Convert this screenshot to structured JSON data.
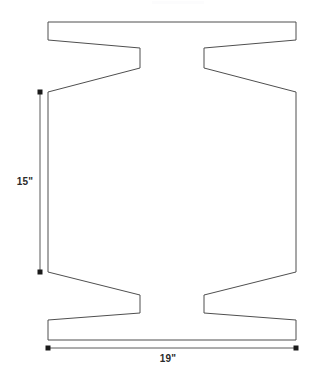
{
  "drawing": {
    "title": "Dimensioned flat pattern part drawing",
    "background_color": "#ffffff",
    "outline_color": "#4f4f4f",
    "dimension_color": "#5a5a5a",
    "label_color": "#2b2b2b",
    "canvas": {
      "width": 313,
      "height": 380
    }
  },
  "dimensions": {
    "height": {
      "label": "15\"",
      "value": 15,
      "unit": "inch",
      "orientation": "vertical",
      "line": {
        "x": 40,
        "y_start": 92,
        "y_end": 272
      },
      "endpoints": [
        {
          "x": 40,
          "y": 92
        },
        {
          "x": 40,
          "y": 272
        }
      ]
    },
    "width": {
      "label": "19\"",
      "value": 19,
      "unit": "inch",
      "orientation": "horizontal",
      "line": {
        "y": 348,
        "x_start": 48,
        "x_end": 296
      },
      "endpoints": [
        {
          "x": 48,
          "y": 348
        },
        {
          "x": 296,
          "y": 348
        }
      ]
    }
  },
  "shape": {
    "type": "closed-polygon",
    "description": "Symmetric hourglass/I-beam flat pattern with top and bottom flanges and two opposing V notches at each end",
    "points": "48,22 296,22 296,40 204,48 204,68 296,92 296,272 204,295 204,313 296,320 296,340 48,340 48,320 140,313 140,295 48,272 48,92 140,68 140,48 48,40",
    "key_vertices": {
      "top_flange_left_outer": {
        "x": 48,
        "y": 22
      },
      "top_flange_right_outer": {
        "x": 296,
        "y": 22
      },
      "top_flange_right_inner": {
        "x": 296,
        "y": 40
      },
      "top_notch_right_upper": {
        "x": 204,
        "y": 48
      },
      "top_notch_right_lower": {
        "x": 204,
        "y": 68
      },
      "waist_right_upper": {
        "x": 296,
        "y": 92
      },
      "waist_right_lower": {
        "x": 296,
        "y": 272
      },
      "bottom_notch_right_upper": {
        "x": 204,
        "y": 295
      },
      "bottom_notch_right_lower": {
        "x": 204,
        "y": 313
      },
      "bottom_flange_right_inner": {
        "x": 296,
        "y": 320
      },
      "bottom_flange_right_outer": {
        "x": 296,
        "y": 340
      },
      "bottom_flange_left_outer": {
        "x": 48,
        "y": 340
      },
      "bottom_flange_left_inner": {
        "x": 48,
        "y": 320
      },
      "bottom_notch_left_lower": {
        "x": 140,
        "y": 313
      },
      "bottom_notch_left_upper": {
        "x": 140,
        "y": 295
      },
      "waist_left_lower": {
        "x": 48,
        "y": 272
      },
      "waist_left_upper": {
        "x": 48,
        "y": 92
      },
      "top_notch_left_lower": {
        "x": 140,
        "y": 68
      },
      "top_notch_left_upper": {
        "x": 140,
        "y": 48
      },
      "top_flange_left_inner": {
        "x": 48,
        "y": 40
      }
    }
  }
}
